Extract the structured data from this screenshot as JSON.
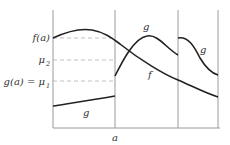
{
  "diagram": {
    "colors": {
      "axis": "#9a9a9a",
      "curve": "#222222",
      "dashed_guide": "#b0b0b0",
      "text": "#333333"
    },
    "y_labels": {
      "f_a": "f(a)",
      "mu2": "μ",
      "mu2_sub": "2",
      "g_a": "g(a) = μ",
      "g_a_sub": "1"
    },
    "x_labels": {
      "a": "a"
    },
    "curve_labels": {
      "g_left": "g",
      "g_middle": "g",
      "g_right": "g",
      "f": "f"
    }
  }
}
